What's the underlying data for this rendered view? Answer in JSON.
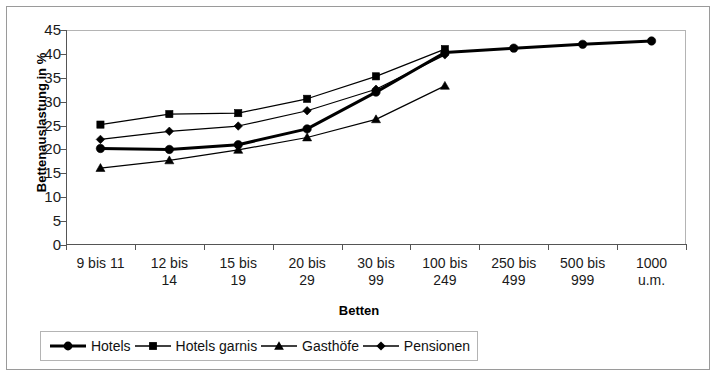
{
  "chart_data": {
    "type": "line",
    "title": "",
    "xlabel": "Betten",
    "ylabel": "Bettenauslastung in %",
    "ylim": [
      0,
      45
    ],
    "ytick_step": 5,
    "yticks": [
      "45",
      "40",
      "35",
      "30",
      "25",
      "20",
      "15",
      "10",
      "5",
      "0"
    ],
    "grid": false,
    "legend_position": "bottom",
    "categories": [
      "9 bis 11",
      "12  bis 14",
      "15 bis 19",
      "20 bis 29",
      "30 bis 99",
      "100 bis 249",
      "250 bis 499",
      "500 bis 999",
      "1000 u.m."
    ],
    "category_lines": [
      [
        "9 bis 11",
        ""
      ],
      [
        "12  bis",
        "14"
      ],
      [
        "15 bis",
        "19"
      ],
      [
        "20 bis",
        "29"
      ],
      [
        "30 bis",
        "99"
      ],
      [
        "100 bis",
        "249"
      ],
      [
        "250 bis",
        "499"
      ],
      [
        "500 bis",
        "999"
      ],
      [
        "1000",
        "u.m."
      ]
    ],
    "series": [
      {
        "name": "Hotels",
        "marker": "circle",
        "emphasis": true,
        "values": [
          20.2,
          20.0,
          21.0,
          24.3,
          32.0,
          40.3,
          41.2,
          42.0,
          42.7
        ]
      },
      {
        "name": "Hotels garnis",
        "marker": "square",
        "emphasis": false,
        "values": [
          25.2,
          27.4,
          27.6,
          30.6,
          35.3,
          41.0,
          null,
          null,
          null
        ]
      },
      {
        "name": "Gasthöfe",
        "marker": "triangle",
        "emphasis": false,
        "values": [
          16.1,
          17.7,
          19.9,
          22.5,
          26.3,
          33.3,
          null,
          null,
          null
        ]
      },
      {
        "name": "Pensionen",
        "marker": "diamond",
        "emphasis": false,
        "values": [
          22.1,
          23.8,
          24.9,
          28.1,
          32.6,
          39.8,
          null,
          null,
          null
        ]
      }
    ],
    "colors": {
      "line": "#000000",
      "marker": "#000000",
      "axis": "#555555",
      "frame": "#b4b4b4",
      "background": "#ffffff"
    }
  }
}
